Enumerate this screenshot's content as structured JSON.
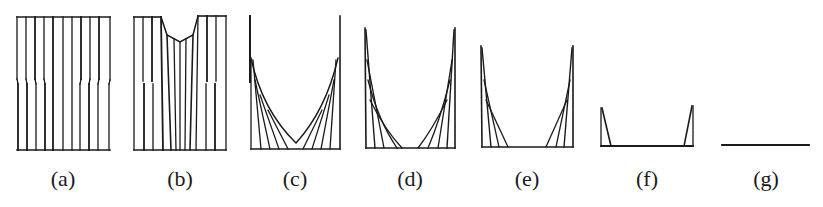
{
  "figure": {
    "type": "sequence-of-schematic-panels",
    "stroke_color": "#1a1a1a",
    "panels": [
      {
        "id": "a",
        "label": "(a)",
        "description": "rectangular block of vertical strips with stepped offsets"
      },
      {
        "id": "b",
        "label": "(b)",
        "description": "strips with V-shaped notch eroded at top center"
      },
      {
        "id": "c",
        "label": "(c)",
        "description": "U-shaped profile with fan of inclined lines to tall side posts"
      },
      {
        "id": "d",
        "label": "(d)",
        "description": "U-shaped profile, flat bottom widening, shorter side posts"
      },
      {
        "id": "e",
        "label": "(e)",
        "description": "further reduced U profile, wider flat bottom"
      },
      {
        "id": "f",
        "label": "(f)",
        "description": "small triangular remnants at both ends of a flat base"
      },
      {
        "id": "g",
        "label": "(g)",
        "description": "flat horizontal line only"
      }
    ]
  }
}
